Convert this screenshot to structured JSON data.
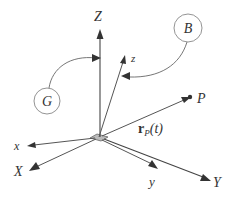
{
  "diagram": {
    "title": "",
    "frames": {
      "global": {
        "label": "G",
        "axes": [
          "X",
          "Y",
          "Z"
        ]
      },
      "body": {
        "label": "B",
        "axes": [
          "x",
          "y",
          "z"
        ]
      }
    },
    "labels": {
      "Z": "Z",
      "z": "z",
      "B": "B",
      "G": "G",
      "P": "P",
      "x": "x",
      "X": "X",
      "y": "y",
      "Y": "Y",
      "r_bold": "r",
      "r_sub": "P",
      "r_arg": "(t)"
    },
    "colors": {
      "line": "#555555",
      "arrow": "#333333",
      "circle": "#888888",
      "text": "#333333",
      "background": "#ffffff"
    }
  }
}
